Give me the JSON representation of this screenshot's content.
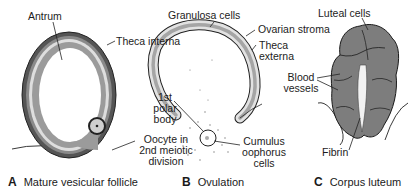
{
  "panels": {
    "A": {
      "letter": "A",
      "caption": "Mature vesicular follicle",
      "labels": {
        "antrum": "Antrum",
        "theca_interna": "Theca interna",
        "oocyte": "Oocyte in 2nd meiotic division",
        "oocyte_l1": "Oocyte in",
        "oocyte_l2": "2nd meiotic",
        "oocyte_l3": "division"
      }
    },
    "B": {
      "letter": "B",
      "caption": "Ovulation",
      "labels": {
        "granulosa": "Granulosa cells",
        "ovarian_stroma": "Ovarian stroma",
        "theca_externa_l1": "Theca",
        "theca_externa_l2": "externa",
        "polar_body_l1": "1st",
        "polar_body_l2": "polar",
        "polar_body_l3": "body",
        "cumulus_l1": "Cumulus",
        "cumulus_l2": "oophorus",
        "cumulus_l3": "cells"
      }
    },
    "C": {
      "letter": "C",
      "caption": "Corpus luteum",
      "labels": {
        "luteal": "Luteal cells",
        "blood_l1": "Blood",
        "blood_l2": "vessels",
        "fibrin": "Fibrin"
      }
    }
  },
  "colors": {
    "theca_dark": "#5a5a5a",
    "granulosa_light": "#d8d8d8",
    "granulosa_mid": "#9a9a9a",
    "luteal": "#7d7d7d",
    "outline": "#1a1a1a"
  }
}
